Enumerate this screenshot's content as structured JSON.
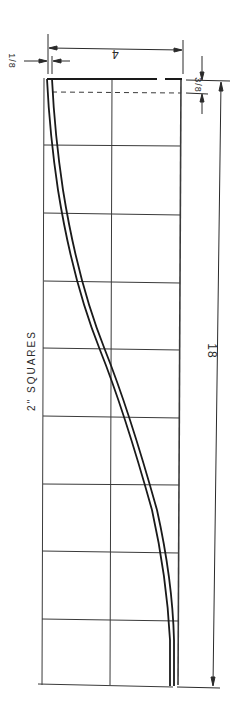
{
  "drawing": {
    "grid_label": "2\" SQUARES",
    "dimensions": {
      "width_label": "4",
      "length_label": "18",
      "top_offset_label": "3/8",
      "side_offset_label": "1/8"
    },
    "grid": {
      "left": 44,
      "right": 181,
      "middle_x": 112,
      "top": 78,
      "bottom": 685,
      "rows": [
        78,
        145,
        213,
        281,
        348,
        416,
        484,
        551,
        619,
        685
      ]
    },
    "curve_points_outer": [
      [
        47,
        78
      ],
      [
        52,
        145
      ],
      [
        62,
        213
      ],
      [
        76,
        281
      ],
      [
        99,
        348
      ],
      [
        122,
        416
      ],
      [
        143,
        484
      ],
      [
        158,
        551
      ],
      [
        167,
        619
      ],
      [
        170,
        685
      ]
    ],
    "curve_points_inner": [
      [
        51,
        78
      ],
      [
        57,
        145
      ],
      [
        67,
        213
      ],
      [
        81,
        281
      ],
      [
        104,
        348
      ],
      [
        127,
        416
      ],
      [
        148,
        484
      ],
      [
        163,
        551
      ],
      [
        172,
        619
      ],
      [
        174,
        685
      ]
    ],
    "colors": {
      "ink": "#1a1a1a",
      "paper": "#ffffff",
      "grid": "#3a3a3a"
    }
  }
}
